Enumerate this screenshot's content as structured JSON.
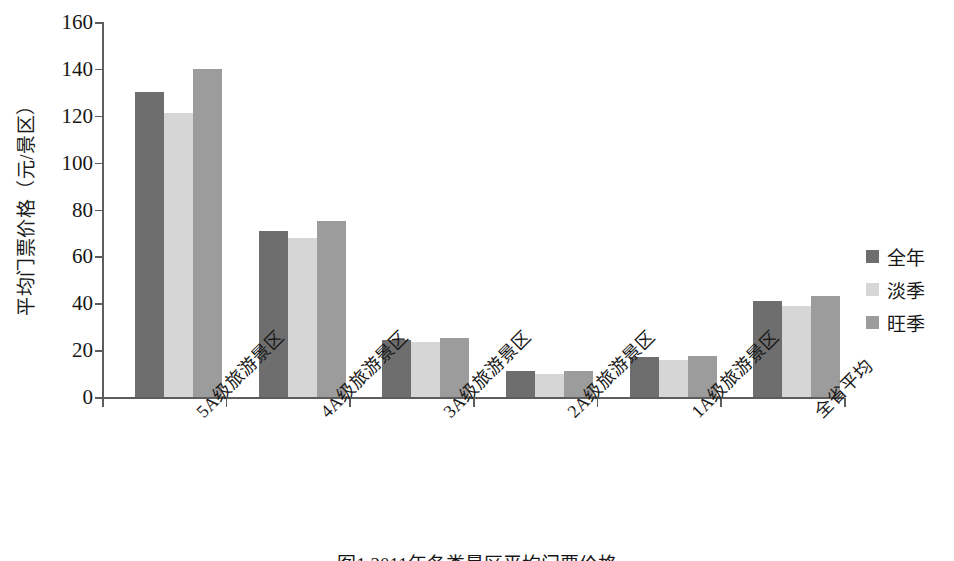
{
  "chart_data": {
    "type": "bar",
    "title": "",
    "caption": "图1 2011年各类景区平均门票价格",
    "xlabel": "",
    "ylabel": "平均门票价格（元/景区）",
    "ylim": [
      0,
      160
    ],
    "ytick_values": [
      0,
      20,
      40,
      60,
      80,
      100,
      120,
      140,
      160
    ],
    "ytick_labels": [
      "0",
      "20",
      "40",
      "60",
      "80",
      "100",
      "120",
      "140",
      "160"
    ],
    "grid": false,
    "legend_position": "right",
    "categories": [
      "5A级旅游景区",
      "4A级旅游景区",
      "3A级旅游景区",
      "2A级旅游景区",
      "1A级旅游景区",
      "全省平均"
    ],
    "series": [
      {
        "name": "全年",
        "color": "#6e6e6e",
        "values": [
          130,
          71,
          24.5,
          11,
          17,
          41
        ]
      },
      {
        "name": "淡季",
        "color": "#d6d6d6",
        "values": [
          121,
          68,
          23.5,
          10,
          16,
          39
        ]
      },
      {
        "name": "旺季",
        "color": "#9c9c9c",
        "values": [
          140,
          75,
          25,
          11,
          17.5,
          43
        ]
      }
    ]
  }
}
